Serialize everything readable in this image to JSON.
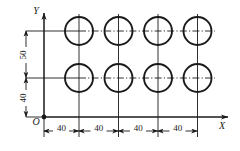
{
  "drawing": {
    "title": "hole-pattern-dimensioned-drawing",
    "axes": {
      "x_label": "X",
      "y_label": "Y",
      "origin_label": "O"
    },
    "colors": {
      "line": "#1a1a1a",
      "background": "#ffffff"
    },
    "horizontal_dimensions": [
      {
        "value": "40"
      },
      {
        "value": "40"
      },
      {
        "value": "40"
      },
      {
        "value": "40"
      }
    ],
    "vertical_dimensions": [
      {
        "value": "50"
      },
      {
        "value": "40"
      }
    ],
    "geometry": {
      "origin_px": {
        "x": 44,
        "y": 117
      },
      "circle_radius_px": 14,
      "column_centers_px": [
        79,
        118.5,
        158,
        197.5
      ],
      "row_centers_px": [
        31,
        78
      ],
      "x_axis_y_px": 117,
      "y_axis_x_px": 44,
      "bottom_dim_line_y_px": 131,
      "left_dim_line_x_px": 26
    }
  }
}
